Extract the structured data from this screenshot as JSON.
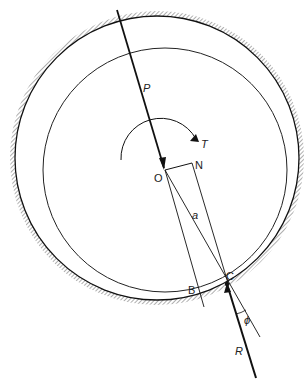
{
  "diagram": {
    "labels": {
      "P": "P",
      "T": "T",
      "O": "O",
      "N": "N",
      "a": "a",
      "B": "B",
      "C": "C",
      "phi": "ϕ",
      "R": "R"
    },
    "outer_circle": {
      "cx": 157,
      "cy": 158,
      "r": 142,
      "style": "hatched bearing surface"
    },
    "inner_circle": {
      "cx": 165,
      "cy": 170,
      "r": 122,
      "style": "journal"
    },
    "points": {
      "O": [
        165,
        170
      ],
      "N": [
        192,
        163
      ],
      "B": [
        200,
        294
      ],
      "C": [
        227,
        284
      ]
    },
    "colors": {
      "line": "#111111",
      "hatch": "#666666"
    }
  }
}
